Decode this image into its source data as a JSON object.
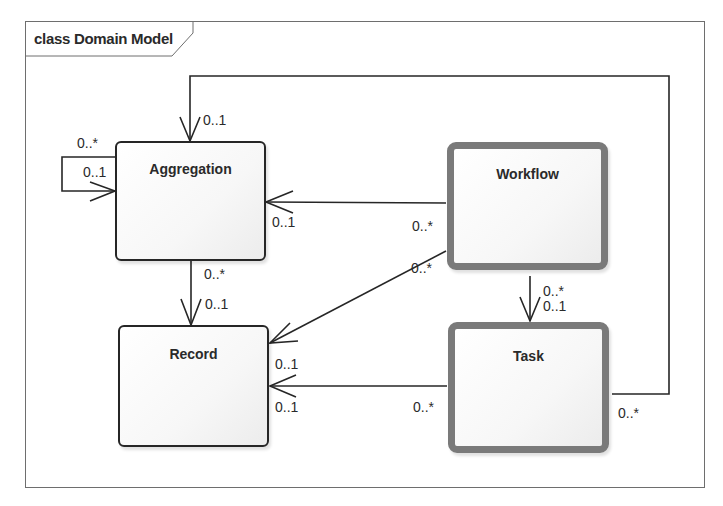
{
  "diagram": {
    "type": "UML class diagram",
    "frame_label": "class Domain Model",
    "classes": [
      {
        "id": "aggregation",
        "name": "Aggregation",
        "style": "normal"
      },
      {
        "id": "workflow",
        "name": "Workflow",
        "style": "highlighted"
      },
      {
        "id": "record",
        "name": "Record",
        "style": "normal"
      },
      {
        "id": "task",
        "name": "Task",
        "style": "highlighted"
      }
    ],
    "associations": [
      {
        "id": "aggregation-self",
        "from": "Aggregation",
        "to": "Aggregation",
        "source_mult": "0..*",
        "target_mult": "0..1"
      },
      {
        "id": "task-aggregation",
        "from": "Task",
        "to": "Aggregation",
        "source_mult": "0..*",
        "target_mult": "0..1"
      },
      {
        "id": "workflow-aggregation",
        "from": "Workflow",
        "to": "Aggregation",
        "source_mult": "0..*",
        "target_mult": "0..1"
      },
      {
        "id": "aggregation-record",
        "from": "Aggregation",
        "to": "Record",
        "source_mult": "0..*",
        "target_mult": "0..1"
      },
      {
        "id": "workflow-record",
        "from": "Workflow",
        "to": "Record",
        "source_mult": "0..*",
        "target_mult": "0..1"
      },
      {
        "id": "workflow-task",
        "from": "Workflow",
        "to": "Task",
        "source_mult": "0..*",
        "target_mult": "0..1"
      },
      {
        "id": "task-record",
        "from": "Task",
        "to": "Record",
        "source_mult": "0..*",
        "target_mult": "0..1"
      }
    ]
  },
  "labels": {
    "self_src": "0..*",
    "self_tgt": "0..1",
    "task_agg_tgt": "0..1",
    "task_agg_src": "0..*",
    "wf_agg_tgt": "0..1",
    "wf_agg_src": "0..*",
    "agg_rec_src": "0..*",
    "agg_rec_tgt": "0..1",
    "wf_rec_src": "0..*",
    "wf_rec_tgt": "0..1",
    "wf_task_src": "0..*",
    "wf_task_tgt": "0..1",
    "task_rec_tgt": "0..1",
    "task_rec_src": "0..*"
  }
}
